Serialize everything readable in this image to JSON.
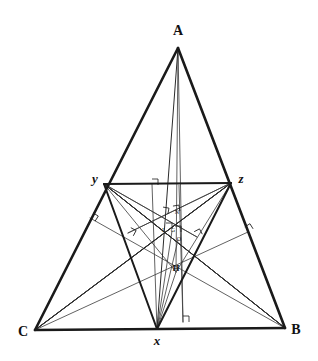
{
  "figure": {
    "canvas": {
      "width": 318,
      "height": 361
    },
    "colors": {
      "stroke_heavy": "#1a1a1a",
      "stroke_medium": "#2b2b2b",
      "stroke_light": "#3a3a3a",
      "background": "#ffffff",
      "label": "#111111"
    },
    "stroke_widths": {
      "outer_triangle": 2.6,
      "medial_triangle": 2.0,
      "cevian": 1.0,
      "thin": 0.8,
      "tick": 0.8
    }
  },
  "points": {
    "A": {
      "label": "A",
      "x": 178,
      "y": 48,
      "label_x": 178,
      "label_y": 35,
      "class": "label-main"
    },
    "B": {
      "label": "B",
      "x": 285,
      "y": 328,
      "label_x": 296,
      "label_y": 334,
      "class": "label-main"
    },
    "C": {
      "label": "C",
      "x": 35,
      "y": 330,
      "label_x": 23,
      "label_y": 336,
      "class": "label-main"
    },
    "x": {
      "label": "x",
      "x": 157,
      "y": 329,
      "label_x": 157,
      "label_y": 345,
      "class": "label-lower"
    },
    "y": {
      "label": "y",
      "x": 104,
      "y": 184,
      "label_x": 95,
      "label_y": 183,
      "class": "label-lower"
    },
    "z": {
      "label": "z",
      "x": 231,
      "y": 183,
      "label_x": 241,
      "label_y": 183,
      "class": "label-lower"
    },
    "H": {
      "label": "H",
      "x": 176,
      "y": 272,
      "label_x": 176,
      "label_y": 271,
      "class": "label-small"
    },
    "O": {
      "label": "O",
      "x": 178,
      "y": 240,
      "label_x": 179,
      "label_y": 241,
      "class": "label-tiny"
    },
    "G": {
      "label": "G",
      "x": 172,
      "y": 231,
      "label_x": 173,
      "label_y": 232,
      "class": "label-tiny"
    },
    "N": {
      "label": "N",
      "x": 176,
      "y": 214,
      "label_x": 177,
      "label_y": 214,
      "class": "label-tiny"
    },
    "I": {
      "label": "I",
      "x": 163,
      "y": 231,
      "label_x": 163,
      "label_y": 232,
      "class": "label-tiny"
    }
  },
  "edges": {
    "outer": [
      {
        "name": "side-AB",
        "from": "A",
        "to": "B"
      },
      {
        "name": "side-AC",
        "from": "A",
        "to": "C"
      },
      {
        "name": "side-CB",
        "from": "C",
        "to": "B"
      }
    ],
    "medial": [
      {
        "name": "segment-yz",
        "from": "y",
        "to": "z"
      },
      {
        "name": "segment-yx",
        "from": "y",
        "to": "x"
      },
      {
        "name": "segment-xz",
        "from": "x",
        "to": "z"
      }
    ],
    "cevians": [
      {
        "name": "cevian-A-x",
        "from": "A",
        "to": "x"
      },
      {
        "name": "cevian-C-z",
        "from": "C",
        "to": "z"
      },
      {
        "name": "cevian-B-y",
        "from": "B",
        "to": "y"
      },
      {
        "name": "segment-y-z-cross-1",
        "from": "y",
        "to": "B"
      },
      {
        "name": "segment-z-C",
        "from": "z",
        "to": "C"
      }
    ],
    "thin": [
      {
        "name": "line-C-to-AB-foot",
        "x1": 35,
        "y1": 330,
        "x2": 248,
        "y2": 232
      },
      {
        "name": "line-B-to-AC-foot",
        "x1": 285,
        "y1": 328,
        "x2": 90,
        "y2": 218
      },
      {
        "name": "line-y-to-xz-foot",
        "x1": 104,
        "y1": 184,
        "x2": 197,
        "y2": 237
      },
      {
        "name": "line-z-to-xy-foot",
        "x1": 231,
        "y1": 183,
        "x2": 128,
        "y2": 233
      },
      {
        "name": "altitude-x-to-yz",
        "x1": 157,
        "y1": 329,
        "x2": 152,
        "y2": 184
      },
      {
        "name": "vertical-through-centers",
        "x1": 183,
        "y1": 322,
        "x2": 179,
        "y2": 185
      },
      {
        "name": "line-A-to-H",
        "x1": 178,
        "y1": 48,
        "x2": 176,
        "y2": 272
      },
      {
        "name": "line-A-to-O",
        "x1": 178,
        "y1": 48,
        "x2": 183,
        "y2": 322
      },
      {
        "name": "line-C-to-H",
        "x1": 35,
        "y1": 330,
        "x2": 231,
        "y2": 183
      },
      {
        "name": "line-B-to-H",
        "x1": 285,
        "y1": 328,
        "x2": 104,
        "y2": 184
      },
      {
        "name": "line-y-to-B-low",
        "x1": 104,
        "y1": 184,
        "x2": 285,
        "y2": 328
      },
      {
        "name": "line-z-to-C-low",
        "x1": 231,
        "y1": 183,
        "x2": 35,
        "y2": 330
      },
      {
        "name": "line-H-to-y",
        "x1": 176,
        "y1": 272,
        "x2": 104,
        "y2": 184
      },
      {
        "name": "line-H-to-z",
        "x1": 176,
        "y1": 272,
        "x2": 231,
        "y2": 183
      },
      {
        "name": "line-H-to-x",
        "x1": 176,
        "y1": 272,
        "x2": 157,
        "y2": 329
      },
      {
        "name": "line-cross-left",
        "x1": 104,
        "y1": 184,
        "x2": 197,
        "y2": 237
      },
      {
        "name": "line-cross-right",
        "x1": 231,
        "y1": 183,
        "x2": 128,
        "y2": 233
      },
      {
        "name": "segment-G-x",
        "x1": 172,
        "y1": 231,
        "x2": 157,
        "y2": 329
      },
      {
        "name": "segment-O-x",
        "x1": 178,
        "y1": 240,
        "x2": 157,
        "y2": 329
      }
    ]
  },
  "right_angle_marks": [
    {
      "name": "right-angle-at-base-foot",
      "x": 183,
      "y": 322,
      "rot": 0
    },
    {
      "name": "right-angle-at-yz-foot",
      "x": 152,
      "y": 185,
      "rot": 0
    },
    {
      "name": "right-angle-on-AC",
      "x": 90,
      "y": 218,
      "rot": 32
    },
    {
      "name": "right-angle-on-AB",
      "x": 248,
      "y": 232,
      "rot": -32
    },
    {
      "name": "right-angle-on-xy",
      "x": 128,
      "y": 233,
      "rot": 28
    },
    {
      "name": "right-angle-on-xz",
      "x": 197,
      "y": 237,
      "rot": -28
    },
    {
      "name": "right-angle-center-left",
      "x": 162,
      "y": 213,
      "rot": 10
    },
    {
      "name": "right-angle-center-right",
      "x": 174,
      "y": 212,
      "rot": -10
    },
    {
      "name": "right-angle-center-mid",
      "x": 166,
      "y": 229,
      "rot": 0
    },
    {
      "name": "right-angle-center-lower",
      "x": 175,
      "y": 232,
      "rot": 0
    }
  ]
}
